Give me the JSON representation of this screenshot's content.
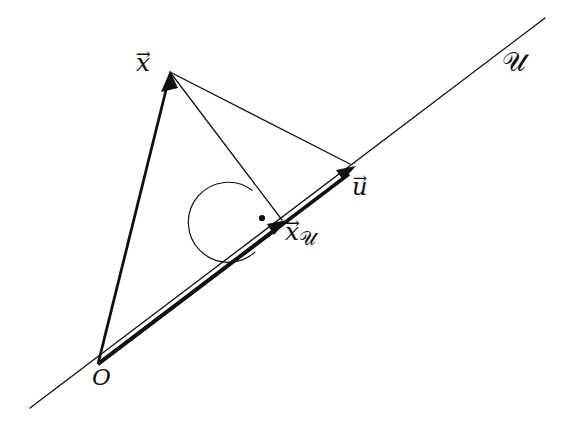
{
  "figure": {
    "background_color": "#ffffff",
    "stroke_color": "#101010",
    "width": 562,
    "height": 428
  },
  "labels": {
    "vector_x": {
      "base": "x",
      "accent": "→",
      "full": "x⃗"
    },
    "vector_u": {
      "base": "u",
      "accent": "→",
      "full": "u⃗"
    },
    "vector_x_projected": {
      "base": "x",
      "accent": "→",
      "subscript": "𝒰",
      "full": "x⃗ᵤ"
    },
    "origin": {
      "text": "O"
    },
    "subspace": {
      "text": "𝒰"
    }
  },
  "geometry": {
    "points": {
      "O": {
        "x": 98,
        "y": 364
      },
      "x": {
        "x": 170,
        "y": 72
      },
      "x_u": {
        "x": 284,
        "y": 222
      },
      "u": {
        "x": 354,
        "y": 166
      },
      "line_start": {
        "x": 30,
        "y": 408
      },
      "line_end": {
        "x": 545,
        "y": 18
      }
    },
    "segments": [
      {
        "name": "line-U",
        "from": "line_start",
        "to": "line_end",
        "weight": 1.2,
        "arrow": false
      },
      {
        "name": "vector-O-to-x",
        "from": "O",
        "to": "x",
        "weight": 2.6,
        "arrow": true
      },
      {
        "name": "vector-O-to-u",
        "from": "O",
        "to": "u",
        "weight": 3.4,
        "arrow": true
      },
      {
        "name": "vector-O-to-xu",
        "from": "O",
        "to": "x_u",
        "weight": 3.4,
        "arrow": true
      },
      {
        "name": "segment-x-to-u",
        "from": "x",
        "to": "u",
        "weight": 1.2,
        "arrow": false
      },
      {
        "name": "segment-x-to-xu",
        "from": "x",
        "to": "x_u",
        "weight": 1.2,
        "arrow": false
      }
    ],
    "right_angle": {
      "center": "x_u",
      "radius": 40,
      "dot_offset": {
        "x": -22,
        "y": -4
      },
      "dot_radius": 3
    }
  }
}
